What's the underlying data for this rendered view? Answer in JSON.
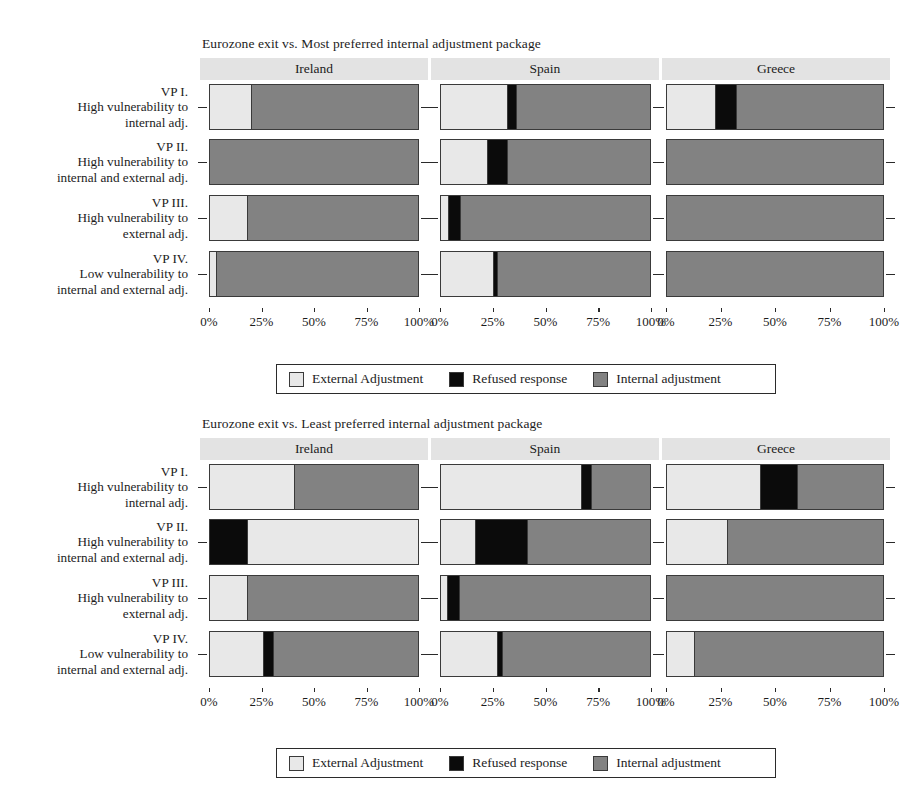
{
  "figure": {
    "width": 922,
    "height": 803,
    "colors": {
      "external": "#e8e8e8",
      "refused": "#0b0b0b",
      "internal": "#828282",
      "strip": "#e3e3e3",
      "outline": "#3a3a3a"
    }
  },
  "legend": {
    "items": [
      {
        "key": "external",
        "label": "External Adjustment"
      },
      {
        "key": "refused",
        "label": "Refused response"
      },
      {
        "key": "internal",
        "label": "Internal adjustment"
      }
    ]
  },
  "axis": {
    "ticks": [
      0,
      25,
      50,
      75,
      100
    ],
    "tick_labels": [
      "0%",
      "25%",
      "50%",
      "75%",
      "100%"
    ]
  },
  "categories": [
    {
      "id": "VP I",
      "lines": [
        "VP I.",
        "High vulnerability to",
        "internal adj."
      ]
    },
    {
      "id": "VP II",
      "lines": [
        "VP II.",
        "High vulnerability to",
        "internal and external adj."
      ]
    },
    {
      "id": "VP III",
      "lines": [
        "VP III.",
        "High vulnerability to",
        "external adj."
      ]
    },
    {
      "id": "VP IV",
      "lines": [
        "VP IV.",
        "Low vulnerability to",
        "internal and external adj."
      ]
    }
  ],
  "countries": [
    "Ireland",
    "Spain",
    "Greece"
  ],
  "chart_data": [
    {
      "type": "bar",
      "orientation": "horizontal",
      "stacked": true,
      "title": "Eurozone exit vs. Most preferred internal adjustment package",
      "xlabel": "",
      "ylabel": "",
      "xlim": [
        0,
        100
      ],
      "tick_labels": [
        "0%",
        "25%",
        "50%",
        "75%",
        "100%"
      ],
      "grid": false,
      "legend_position": "bottom",
      "facets": [
        "Ireland",
        "Spain",
        "Greece"
      ],
      "categories": [
        "VP I",
        "VP II",
        "VP III",
        "VP IV"
      ],
      "series": [
        {
          "name": "External Adjustment",
          "key": "external"
        },
        {
          "name": "Refused response",
          "key": "refused"
        },
        {
          "name": "Internal adjustment",
          "key": "internal"
        }
      ],
      "values": {
        "Ireland": {
          "VP I": {
            "external": 19.5,
            "refused": 0.0,
            "internal": 80.5
          },
          "VP II": {
            "external": 0.0,
            "refused": 0.0,
            "internal": 100.0
          },
          "VP III": {
            "external": 17.6,
            "refused": 0.0,
            "internal": 82.4
          },
          "VP IV": {
            "external": 3.0,
            "refused": 0.0,
            "internal": 97.0
          }
        },
        "Spain": {
          "VP I": {
            "external": 31.8,
            "refused": 4.3,
            "internal": 63.9
          },
          "VP II": {
            "external": 21.8,
            "refused": 10.0,
            "internal": 68.2
          },
          "VP III": {
            "external": 3.3,
            "refused": 5.7,
            "internal": 91.0
          },
          "VP IV": {
            "external": 25.1,
            "refused": 1.9,
            "internal": 73.0
          }
        },
        "Greece": {
          "VP I": {
            "external": 22.0,
            "refused": 10.1,
            "internal": 67.9
          },
          "VP II": {
            "external": 0.0,
            "refused": 0.0,
            "internal": 100.0
          },
          "VP III": {
            "external": 0.0,
            "refused": 0.0,
            "internal": 100.0
          },
          "VP IV": {
            "external": 0.0,
            "refused": 0.0,
            "internal": 100.0
          }
        }
      }
    },
    {
      "type": "bar",
      "orientation": "horizontal",
      "stacked": true,
      "title": "Eurozone exit vs. Least preferred internal adjustment package",
      "xlabel": "",
      "ylabel": "",
      "xlim": [
        0,
        100
      ],
      "tick_labels": [
        "0%",
        "25%",
        "50%",
        "75%",
        "100%"
      ],
      "grid": false,
      "legend_position": "bottom",
      "facets": [
        "Ireland",
        "Spain",
        "Greece"
      ],
      "categories": [
        "VP I",
        "VP II",
        "VP III",
        "VP IV"
      ],
      "series": [
        {
          "name": "External Adjustment",
          "key": "external"
        },
        {
          "name": "Refused response",
          "key": "refused"
        },
        {
          "name": "Internal adjustment",
          "key": "internal"
        }
      ],
      "values": {
        "Ireland": {
          "VP I": {
            "external": 40.5,
            "refused": 0.0,
            "internal": 59.5
          },
          "VP II": {
            "external": 82.0,
            "refused": 18.0,
            "internal": 0.0,
            "order": "refused,external"
          },
          "VP III": {
            "external": 18.0,
            "refused": 0.0,
            "internal": 82.0
          },
          "VP IV": {
            "external": 25.5,
            "refused": 4.8,
            "internal": 69.7
          }
        },
        "Spain": {
          "VP I": {
            "external": 66.8,
            "refused": 5.2,
            "internal": 28.0
          },
          "VP II": {
            "external": 16.2,
            "refused": 25.0,
            "internal": 58.8
          },
          "VP III": {
            "external": 3.0,
            "refused": 5.5,
            "internal": 91.5
          },
          "VP IV": {
            "external": 26.8,
            "refused": 2.3,
            "internal": 70.9
          }
        },
        "Greece": {
          "VP I": {
            "external": 43.0,
            "refused": 17.0,
            "internal": 40.0
          },
          "VP II": {
            "external": 27.8,
            "refused": 0.0,
            "internal": 72.2
          },
          "VP III": {
            "external": 0.0,
            "refused": 0.0,
            "internal": 100.0
          },
          "VP IV": {
            "external": 12.4,
            "refused": 0.0,
            "internal": 87.6
          }
        }
      }
    }
  ],
  "layout": {
    "panels": [
      {
        "country": "Ireland",
        "left": 209,
        "width": 210,
        "strip_left": 200,
        "strip_width": 228
      },
      {
        "country": "Spain",
        "left": 440,
        "width": 211,
        "strip_left": 431,
        "strip_width": 228
      },
      {
        "country": "Greece",
        "left": 666,
        "width": 218,
        "strip_left": 662,
        "strip_width": 228
      }
    ],
    "row_tops": [
      0,
      55,
      111,
      167
    ],
    "row_height": 46
  }
}
